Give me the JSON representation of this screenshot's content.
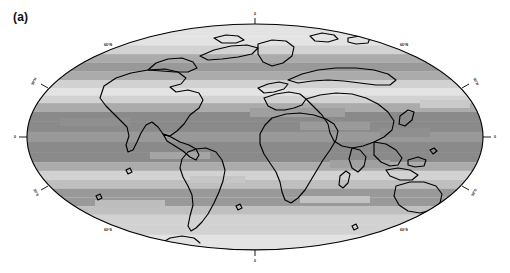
{
  "figure": {
    "panel_label": "(a)",
    "projection": "mollweide",
    "background_color": "#ffffff",
    "outline_color": "#000000"
  },
  "chart_data": {
    "type": "heatmap",
    "title": "",
    "subtitle": "",
    "xlabel": "",
    "ylabel": "",
    "grid": false,
    "legend_position": "none",
    "projection": "mollweide",
    "xlim": [
      -180,
      180
    ],
    "ylim": [
      -90,
      90
    ],
    "x_tick_labels": [
      "0",
      "0"
    ],
    "y_tick_labels": [
      "60°N",
      "30°N",
      "0",
      "30°S",
      "60°S"
    ],
    "latitude_ticks": [
      60,
      30,
      0,
      -30,
      -60
    ],
    "longitude_ticks": [
      0
    ],
    "colormap": "grayscale",
    "band_legend": [
      {
        "index": 0,
        "color": "#f4f4f4"
      },
      {
        "index": 1,
        "color": "#e3e3e3"
      },
      {
        "index": 2,
        "color": "#d2d2d2"
      },
      {
        "index": 3,
        "color": "#bfbfbf"
      },
      {
        "index": 4,
        "color": "#ababab"
      },
      {
        "index": 5,
        "color": "#999999"
      },
      {
        "index": 6,
        "color": "#8a8a8a"
      },
      {
        "index": 7,
        "color": "#7d7d7d"
      }
    ],
    "categories": [
      "90°N-80°N",
      "80°N-72°N",
      "72°N-64°N",
      "64°N-57°N",
      "57°N-50°N",
      "50°N-43°N",
      "43°N-36°N",
      "36°N-29°N",
      "29°N-22°N",
      "22°N-15°N",
      "15°N-8°N",
      "8°N-0°",
      "0°-8°S",
      "8°S-15°S",
      "15°S-22°S",
      "22°S-29°S",
      "29°S-36°S",
      "36°S-43°S",
      "43°S-50°S",
      "50°S-57°S",
      "57°S-64°S",
      "64°S-72°S",
      "72°S-80°S",
      "80°S-90°S"
    ],
    "values": [
      1,
      1,
      2,
      4,
      5,
      6,
      6,
      5,
      3,
      2,
      4,
      6,
      6,
      5,
      3,
      2,
      3,
      5,
      6,
      5,
      3,
      2,
      2,
      2
    ],
    "zonal_bands": [
      {
        "lat_top": 90,
        "lat_bottom": 80,
        "value": 1,
        "color": "#e3e3e3"
      },
      {
        "lat_top": 80,
        "lat_bottom": 73,
        "value": 1,
        "color": "#e3e3e3"
      },
      {
        "lat_top": 73,
        "lat_bottom": 66,
        "value": 2,
        "color": "#d2d2d2"
      },
      {
        "lat_top": 66,
        "lat_bottom": 59,
        "value": 4,
        "color": "#ababab"
      },
      {
        "lat_top": 59,
        "lat_bottom": 52,
        "value": 5,
        "color": "#999999"
      },
      {
        "lat_top": 52,
        "lat_bottom": 45,
        "value": 4,
        "color": "#ababab"
      },
      {
        "lat_top": 45,
        "lat_bottom": 39,
        "value": 2,
        "color": "#d2d2d2"
      },
      {
        "lat_top": 39,
        "lat_bottom": 33,
        "value": 1,
        "color": "#e3e3e3"
      },
      {
        "lat_top": 33,
        "lat_bottom": 27,
        "value": 2,
        "color": "#d2d2d2"
      },
      {
        "lat_top": 27,
        "lat_bottom": 20,
        "value": 4,
        "color": "#ababab"
      },
      {
        "lat_top": 20,
        "lat_bottom": 12,
        "value": 6,
        "color": "#8a8a8a"
      },
      {
        "lat_top": 12,
        "lat_bottom": 4,
        "value": 6,
        "color": "#8a8a8a"
      },
      {
        "lat_top": 4,
        "lat_bottom": -4,
        "value": 5,
        "color": "#999999"
      },
      {
        "lat_top": -4,
        "lat_bottom": -12,
        "value": 6,
        "color": "#8a8a8a"
      },
      {
        "lat_top": -12,
        "lat_bottom": -20,
        "value": 6,
        "color": "#8a8a8a"
      },
      {
        "lat_top": -20,
        "lat_bottom": -27,
        "value": 4,
        "color": "#ababab"
      },
      {
        "lat_top": -27,
        "lat_bottom": -34,
        "value": 2,
        "color": "#d2d2d2"
      },
      {
        "lat_top": -34,
        "lat_bottom": -41,
        "value": 3,
        "color": "#bfbfbf"
      },
      {
        "lat_top": -41,
        "lat_bottom": -48,
        "value": 5,
        "color": "#999999"
      },
      {
        "lat_top": -48,
        "lat_bottom": -55,
        "value": 5,
        "color": "#999999"
      },
      {
        "lat_top": -55,
        "lat_bottom": -62,
        "value": 3,
        "color": "#bfbfbf"
      },
      {
        "lat_top": -62,
        "lat_bottom": -70,
        "value": 2,
        "color": "#d2d2d2"
      },
      {
        "lat_top": -70,
        "lat_bottom": -78,
        "value": 2,
        "color": "#d2d2d2"
      },
      {
        "lat_top": -78,
        "lat_bottom": -90,
        "value": 1,
        "color": "#e3e3e3"
      }
    ]
  },
  "labels": {
    "lat_60n_left": "60°N",
    "lat_60n_right": "60°N",
    "lat_30n_left": "30°N",
    "lat_30n_right": "30°N",
    "lat_0_left": "0",
    "lat_0_right": "0",
    "lat_30s_left": "30°S",
    "lat_30s_right": "30°S",
    "lat_60s_left": "60°S",
    "lat_60s_right": "60°S",
    "lon_0_top": "0",
    "lon_0_bottom": "0"
  }
}
